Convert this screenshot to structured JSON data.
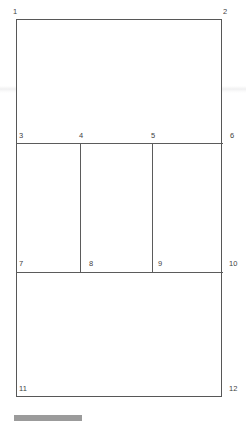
{
  "diagram": {
    "type": "wireframe-grid",
    "background_color": "#ffffff",
    "line_color": "#5b5b5b",
    "label_color": "#3f3f3f",
    "frame": {
      "x": 16,
      "y": 19,
      "width": 206,
      "height": 378
    },
    "rows": [
      {
        "name": "top-region",
        "top": 19,
        "bottom": 143,
        "columns": 1
      },
      {
        "name": "middle-region",
        "top": 143,
        "bottom": 272,
        "columns": 3
      },
      {
        "name": "bottom-region",
        "top": 272,
        "bottom": 397,
        "columns": 1
      }
    ],
    "vertical_dividers": [
      80,
      152
    ],
    "horizontal_dividers": [
      143,
      272
    ],
    "corner_labels": [
      {
        "id": "1",
        "text": "1",
        "position": "top-left-outside"
      },
      {
        "id": "2",
        "text": "2",
        "position": "top-right-outside"
      },
      {
        "id": "3",
        "text": "3",
        "position": "row2-col1-topleft"
      },
      {
        "id": "4",
        "text": "4",
        "position": "row2-col2-topleft"
      },
      {
        "id": "5",
        "text": "5",
        "position": "row2-col3-topleft"
      },
      {
        "id": "6",
        "text": "6",
        "position": "row2-topright-outside"
      },
      {
        "id": "7",
        "text": "7",
        "position": "row2-col1-bottomleft"
      },
      {
        "id": "8",
        "text": "8",
        "position": "row2-col2-bottomleft"
      },
      {
        "id": "9",
        "text": "9",
        "position": "row2-col3-bottomleft"
      },
      {
        "id": "10",
        "text": "10",
        "position": "row2-bottomright-outside"
      },
      {
        "id": "11",
        "text": "11",
        "position": "row3-bottomleft"
      },
      {
        "id": "12",
        "text": "12",
        "position": "row3-bottomright-outside"
      }
    ],
    "bottom_bar": {
      "name": "scrollbar-thumb",
      "color": "#9b9b9b",
      "x": 14,
      "y": 415,
      "width": 68,
      "height": 6
    }
  }
}
